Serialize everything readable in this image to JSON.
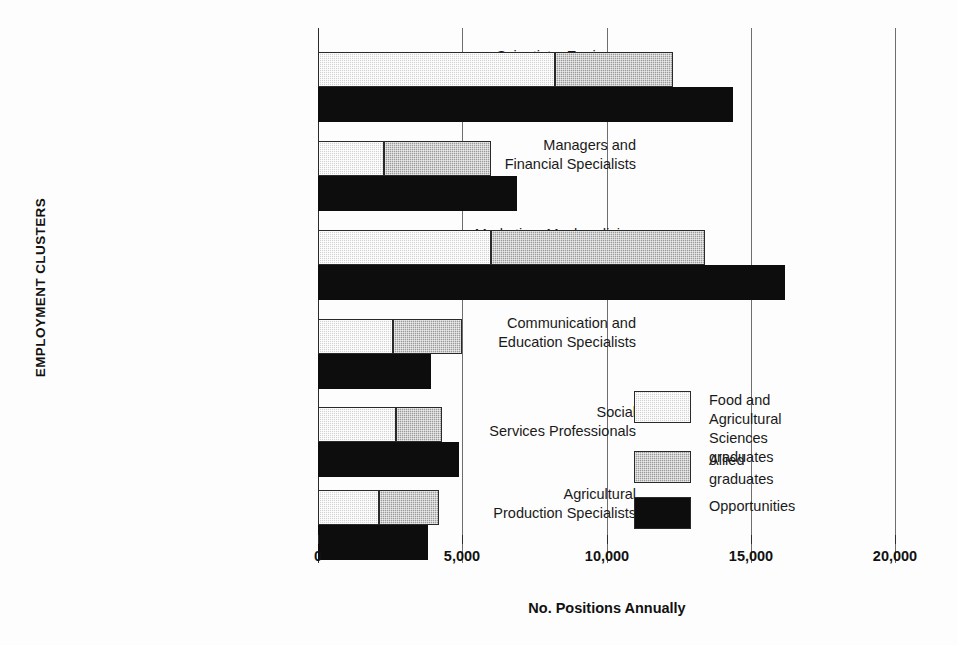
{
  "chart_data": {
    "type": "bar",
    "orientation": "horizontal",
    "title": "",
    "xlabel": "No. Positions Annually",
    "ylabel": "EMPLOYMENT CLUSTERS",
    "xlim": [
      0,
      20000
    ],
    "grid": true,
    "grid_axis": "x",
    "legend_position": "inside-right",
    "xticks": [
      0,
      5000,
      10000,
      15000,
      20000
    ],
    "xticklabels": [
      "0",
      "5,000",
      "10,000",
      "15,000",
      "20,000"
    ],
    "categories": [
      "Scientists, Engineers,\nand Related Specialists",
      "Managers and\nFinancial Specialists",
      "Marketing, Mechandising\nand Sales Representatives",
      "Communication and\nEducation Specialists",
      "Social\nServices Professionals",
      "Agricultural\nProduction Specialists"
    ],
    "series": [
      {
        "name": "Food and Agricultural\nSciences graduates",
        "color": "#d2d2d2",
        "stacked_with": "Allied graduates",
        "values": [
          8200,
          2300,
          6000,
          2600,
          2700,
          2100
        ]
      },
      {
        "name": "Allied graduates",
        "color": "#9a9a9a",
        "stacked_with": "Food and Agricultural Sciences graduates",
        "values": [
          4100,
          3700,
          7400,
          2400,
          1600,
          2100
        ]
      },
      {
        "name": "Opportunities",
        "color": "#0d0d0d",
        "stacked_with": null,
        "values": [
          14400,
          6900,
          16200,
          3900,
          4900,
          3800
        ]
      }
    ],
    "stacked_totals": [
      12300,
      6000,
      13400,
      5000,
      4300,
      4200
    ]
  },
  "axes": {
    "x_title": "No. Positions Annually",
    "y_title": "EMPLOYMENT CLUSTERS",
    "x_tick_labels": [
      "0",
      "5,000",
      "10,000",
      "15,000",
      "20,000"
    ]
  },
  "categories": [
    {
      "line1": "Scientists, Engineers,",
      "line2": "and Related Specialists"
    },
    {
      "line1": "Managers and",
      "line2": "Financial Specialists"
    },
    {
      "line1": "Marketing, Mechandising",
      "line2": "and Sales Representatives"
    },
    {
      "line1": "Communication and",
      "line2": "Education Specialists"
    },
    {
      "line1": "Social",
      "line2": "Services Professionals"
    },
    {
      "line1": "Agricultural",
      "line2": "Production Specialists"
    }
  ],
  "legend": {
    "items": [
      {
        "label": "Food and Agricultural\nSciences graduates",
        "color": "#d2d2d2"
      },
      {
        "label": "Allied graduates",
        "color": "#9a9a9a"
      },
      {
        "label": "Opportunities",
        "color": "#0d0d0d"
      }
    ]
  }
}
